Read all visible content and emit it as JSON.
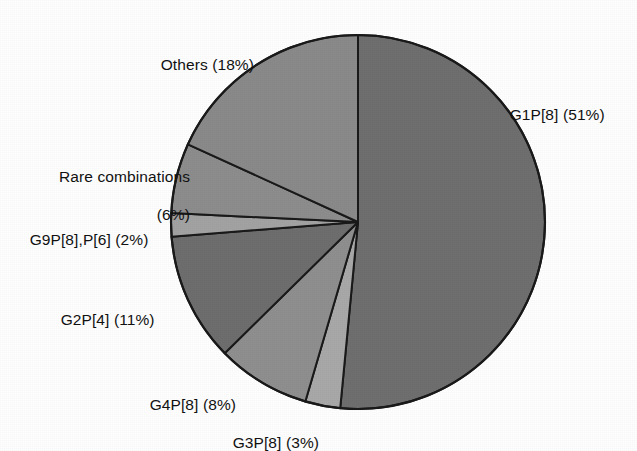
{
  "figure": {
    "background_color": "#ffffff",
    "outline_color": "#1a1a1a",
    "center": {
      "x": 358,
      "y": 222
    },
    "radius": 187
  },
  "chart_data": {
    "type": "pie",
    "title": "",
    "subtitle": "",
    "xlabel": "",
    "ylabel": "",
    "legend_position": "none",
    "grid": false,
    "start_angle_deg": 90,
    "direction": "clockwise",
    "units": "percent",
    "categories": [
      "G1P[8]",
      "G3P[8]",
      "G4P[8]",
      "G2P[4]",
      "G9P[8],P[6]",
      "Rare combinations",
      "Others"
    ],
    "values": [
      51,
      3,
      8,
      11,
      2,
      6,
      18
    ],
    "colors": [
      "#6f6f6f",
      "#a9a9a9",
      "#8f8f8f",
      "#6e6e6e",
      "#a3a3a3",
      "#8d8d8d",
      "#8a8a8a"
    ],
    "slices": [
      {
        "label": "G1P[8]",
        "value": 51,
        "label_text": "G1P[8] (51%)",
        "color": "#6f6f6f"
      },
      {
        "label": "G3P[8]",
        "value": 3,
        "label_text": "G3P[8] (3%)",
        "color": "#a9a9a9"
      },
      {
        "label": "G4P[8]",
        "value": 8,
        "label_text": "G4P[8] (8%)",
        "color": "#8f8f8f"
      },
      {
        "label": "G2P[4]",
        "value": 11,
        "label_text": "G2P[4] (11%)",
        "color": "#6e6e6e"
      },
      {
        "label": "G9P[8],P[6]",
        "value": 2,
        "label_text": "G9P[8],P[6] (2%)",
        "color": "#a3a3a3"
      },
      {
        "label": "Rare combinations",
        "value": 6,
        "label_text": "Rare combinations (6%)",
        "color": "#8d8d8d"
      },
      {
        "label": "Others",
        "value": 18,
        "label_text": "Others (18%)",
        "color": "#8a8a8a"
      }
    ]
  },
  "labels": {
    "others": "Others (18%)",
    "g1p8": "G1P[8] (51%)",
    "rare_line1": "Rare combinations",
    "rare_line2": "(6%)",
    "g9p8p6": "G9P[8],P[6] (2%)",
    "g2p4": "G2P[4] (11%)",
    "g4p8": "G4P[8] (8%)",
    "g3p8": "G3P[8] (3%)"
  }
}
